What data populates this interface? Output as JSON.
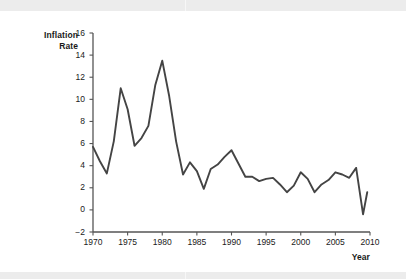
{
  "figure": {
    "background_color": "#ffffff",
    "band_color": "#ececec",
    "line_color": "#444444",
    "axis_color": "#555555",
    "text_color": "#1a1a1a"
  },
  "chart_data": {
    "type": "line",
    "title": "",
    "xlabel": "Year",
    "ylabel": "Inflation Rate",
    "ylabel_lines": [
      "Inflation",
      "Rate"
    ],
    "xlim": [
      1970,
      2010
    ],
    "ylim": [
      -2,
      16
    ],
    "xticks": [
      1970,
      1975,
      1980,
      1985,
      1990,
      1995,
      2000,
      2005,
      2010
    ],
    "xtick_labels": [
      "1970",
      "1975",
      "1980",
      "1985",
      "1990",
      "1995",
      "2000",
      "2005",
      "2010"
    ],
    "yticks": [
      -2,
      0,
      2,
      4,
      6,
      8,
      10,
      12,
      14,
      16
    ],
    "ytick_labels": [
      "−2",
      "0",
      "2",
      "4",
      "6",
      "8",
      "10",
      "12",
      "14",
      "16"
    ],
    "grid": false,
    "legend": false,
    "series": [
      {
        "name": "Inflation Rate",
        "color": "#444444",
        "x": [
          1970,
          1971,
          1972,
          1973,
          1974,
          1975,
          1976,
          1977,
          1978,
          1979,
          1980,
          1981,
          1982,
          1983,
          1984,
          1985,
          1986,
          1987,
          1988,
          1989,
          1990,
          1991,
          1992,
          1993,
          1994,
          1995,
          1996,
          1997,
          1998,
          1999,
          2000,
          2001,
          2002,
          2003,
          2004,
          2005,
          2006,
          2007,
          2008,
          2009
        ],
        "values": [
          5.7,
          4.4,
          3.3,
          6.2,
          11.0,
          9.1,
          5.8,
          6.5,
          7.6,
          11.3,
          13.5,
          10.3,
          6.2,
          3.2,
          4.3,
          3.5,
          1.9,
          3.7,
          4.1,
          4.8,
          5.4,
          4.2,
          3.0,
          3.0,
          2.6,
          2.8,
          2.9,
          2.3,
          1.6,
          2.2,
          3.4,
          2.8,
          1.6,
          2.3,
          2.7,
          3.4,
          3.2,
          2.9,
          3.8,
          -0.4
        ],
        "last_point_value": 1.6
      }
    ]
  }
}
